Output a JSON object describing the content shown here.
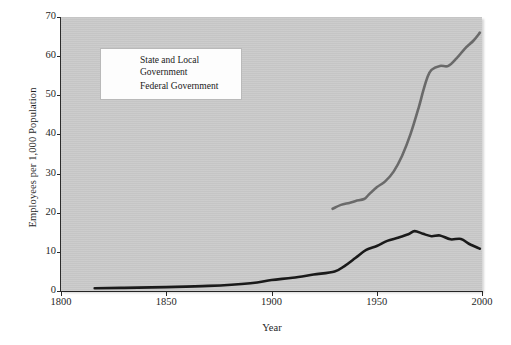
{
  "chart_data": {
    "type": "line",
    "title": "",
    "xlabel": "Year",
    "ylabel": "Employees per 1,000 Population",
    "xlim": [
      1800,
      2000
    ],
    "ylim": [
      0,
      70
    ],
    "grid": false,
    "legend_position": "upper-left-inside",
    "xticks": [
      "1800",
      "1850",
      "1900",
      "1950",
      "2000"
    ],
    "yticks": [
      "0",
      "10",
      "20",
      "30",
      "40",
      "50",
      "60",
      "70"
    ],
    "series": [
      {
        "name": "State and Local Government",
        "color": "#6a6a6a",
        "x": [
          1929,
          1933,
          1937,
          1940,
          1944,
          1946,
          1950,
          1954,
          1958,
          1962,
          1966,
          1970,
          1972,
          1974,
          1976,
          1980,
          1984,
          1988,
          1992,
          1996,
          1999
        ],
        "values": [
          21.0,
          22.0,
          22.5,
          23.0,
          23.5,
          24.5,
          26.5,
          28.0,
          30.5,
          34.5,
          40.0,
          47.0,
          51.0,
          54.5,
          56.5,
          57.5,
          57.5,
          59.5,
          62.0,
          64.0,
          66.0
        ]
      },
      {
        "name": "Federal Government",
        "color": "#1a1a1a",
        "x": [
          1816,
          1830,
          1850,
          1870,
          1890,
          1900,
          1910,
          1920,
          1930,
          1935,
          1940,
          1945,
          1950,
          1955,
          1960,
          1965,
          1968,
          1972,
          1976,
          1980,
          1985,
          1990,
          1994,
          1999
        ],
        "values": [
          0.7,
          0.8,
          1.0,
          1.3,
          2.0,
          2.8,
          3.4,
          4.2,
          5.0,
          6.5,
          8.5,
          10.5,
          11.5,
          12.8,
          13.6,
          14.5,
          15.3,
          14.6,
          14.0,
          14.2,
          13.2,
          13.3,
          12.0,
          10.8
        ]
      }
    ]
  },
  "legend": {
    "items": [
      {
        "label_line1": "State and Local",
        "label_line2": "Government",
        "color": "#6a6a6a"
      },
      {
        "label_line1": "Federal Government",
        "label_line2": "",
        "color": "#1a1a1a"
      }
    ]
  }
}
